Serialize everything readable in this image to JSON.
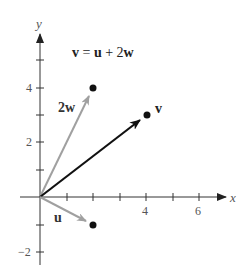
{
  "diagram": {
    "equation": {
      "v": "v",
      "eq": " = ",
      "u": "u",
      "plus": " + 2",
      "w": "w"
    },
    "axes": {
      "x_label": "x",
      "y_label": "y",
      "x_ticks": [
        {
          "value": 4,
          "label": "4"
        },
        {
          "value": 6,
          "label": "6"
        }
      ],
      "y_ticks": [
        {
          "value": 4,
          "label": "4"
        },
        {
          "value": 2,
          "label": "2"
        },
        {
          "value": -2,
          "label": "−2"
        }
      ]
    },
    "vectors": [
      {
        "name": "u",
        "label": "u",
        "end": [
          2,
          -1
        ],
        "color": "#a0a0a0"
      },
      {
        "name": "2w",
        "label": "2w",
        "end": [
          2,
          4
        ],
        "color": "#a0a0a0"
      },
      {
        "name": "v",
        "label": "v",
        "end": [
          4,
          3
        ],
        "color": "#111111"
      }
    ],
    "colors": {
      "axis": "#333333",
      "gray_vector": "#a0a0a0",
      "black_vector": "#111111",
      "point": "#111111"
    }
  }
}
